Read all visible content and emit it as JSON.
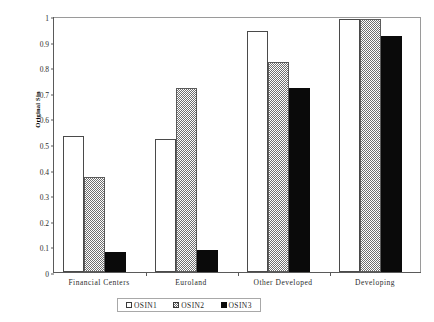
{
  "chart_data": {
    "type": "bar",
    "title": "",
    "xlabel": "",
    "ylabel": "Original Sin",
    "ylim": [
      0,
      1
    ],
    "yticks": [
      "0",
      "0.1",
      "0.2",
      "0.3",
      "0.4",
      "0.5",
      "0.6",
      "0.7",
      "0.8",
      "0.9",
      "1"
    ],
    "ytick_values": [
      0,
      0.1,
      0.2,
      0.3,
      0.4,
      0.5,
      0.6,
      0.7,
      0.8,
      0.9,
      1
    ],
    "grid": false,
    "legend_position": "bottom",
    "categories": [
      "Financial Centers",
      "Euroland",
      "Other Developed",
      "Developing"
    ],
    "series": [
      {
        "name": "OSIN1",
        "style": "white-outline",
        "color": "#ffffff",
        "values": [
          0.53,
          0.52,
          0.94,
          0.99
        ]
      },
      {
        "name": "OSIN2",
        "style": "gray-hatch",
        "color": "#6f6f6f",
        "values": [
          0.37,
          0.72,
          0.82,
          0.99
        ]
      },
      {
        "name": "OSIN3",
        "style": "solid-black",
        "color": "#0a0a0a",
        "values": [
          0.08,
          0.085,
          0.72,
          0.92
        ]
      }
    ]
  }
}
